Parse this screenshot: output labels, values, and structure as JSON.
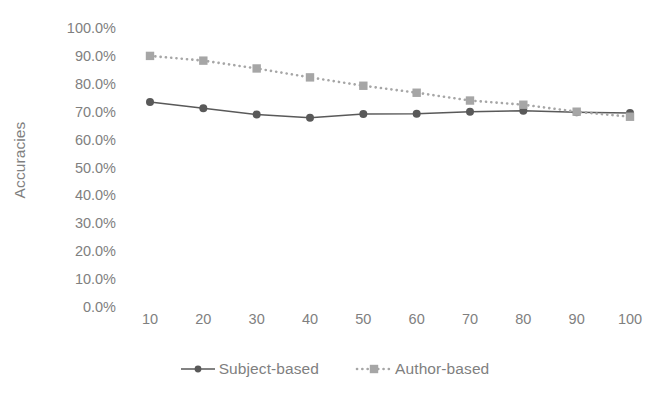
{
  "chart_data": {
    "type": "line",
    "title": "",
    "xlabel": "",
    "ylabel": "Accuracies",
    "categories": [
      "10",
      "20",
      "30",
      "40",
      "50",
      "60",
      "70",
      "80",
      "90",
      "100"
    ],
    "x": [
      10,
      20,
      30,
      40,
      50,
      60,
      70,
      80,
      90,
      100
    ],
    "xlim": [
      10,
      100
    ],
    "ylim": [
      0,
      100
    ],
    "y_unit": "%",
    "grid": false,
    "legend_position": "bottom",
    "series": [
      {
        "name": "Subject-based",
        "style": "solid",
        "marker": "circle",
        "color": "#595959",
        "values": [
          73.5,
          71.2,
          69.0,
          67.8,
          69.2,
          69.3,
          70.0,
          70.3,
          69.8,
          69.5
        ]
      },
      {
        "name": "Author-based",
        "style": "dotted",
        "marker": "square",
        "color": "#a6a6a6",
        "values": [
          90.0,
          88.3,
          85.5,
          82.3,
          79.3,
          76.8,
          74.0,
          72.5,
          70.0,
          68.2
        ]
      }
    ],
    "y_ticks": [
      {
        "value": 100,
        "label": "100.0%"
      },
      {
        "value": 90,
        "label": "90.0%"
      },
      {
        "value": 80,
        "label": "80.0%"
      },
      {
        "value": 70,
        "label": "70.0%"
      },
      {
        "value": 60,
        "label": "60.0%"
      },
      {
        "value": 50,
        "label": "50.0%"
      },
      {
        "value": 40,
        "label": "40.0%"
      },
      {
        "value": 30,
        "label": "30.0%"
      },
      {
        "value": 20,
        "label": "20.0%"
      },
      {
        "value": 10,
        "label": "10.0%"
      },
      {
        "value": 0,
        "label": "0.0%"
      }
    ],
    "colors": {
      "text": "#7f7f7f",
      "subject_series": "#595959",
      "author_series": "#a6a6a6",
      "background": "#ffffff"
    }
  },
  "legend": {
    "entries": [
      {
        "label": "Subject-based"
      },
      {
        "label": "Author-based"
      }
    ]
  },
  "axis": {
    "y_title": "Accuracies"
  }
}
